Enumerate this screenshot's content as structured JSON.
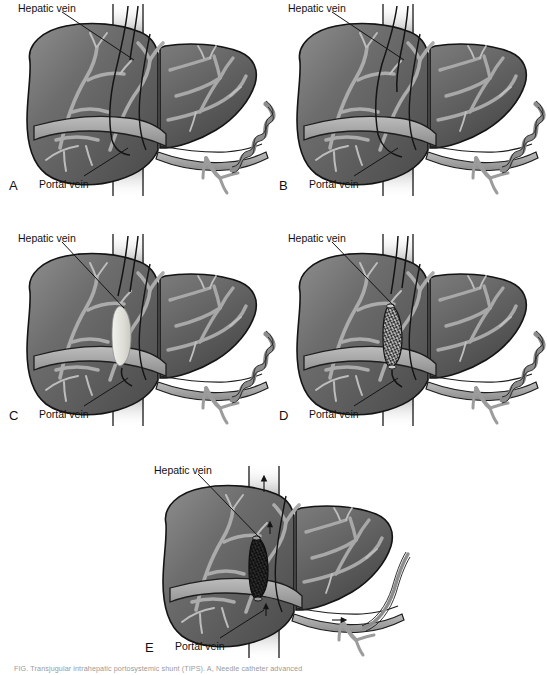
{
  "figure": {
    "type": "medical-illustration",
    "background_color": "#ffffff",
    "panel_count": 5,
    "caption": "FIG. Transjugular intrahepatic portosystemic shunt (TIPS). A, Needle catheter advanced"
  },
  "labels": {
    "hepatic_vein": "Hepatic vein",
    "portal_vein": "Portal vein"
  },
  "panels": [
    {
      "letter": "A",
      "label_hepatic": "Hepatic vein",
      "label_portal": "Portal vein",
      "stage": "catheter-in-hepatic-vein",
      "has_stent": false,
      "has_tract": false,
      "varices": "dilated"
    },
    {
      "letter": "B",
      "label_hepatic": "Hepatic vein",
      "label_portal": "Portal vein",
      "stage": "needle-puncture-to-portal-vein",
      "has_stent": false,
      "has_tract": false,
      "varices": "dilated"
    },
    {
      "letter": "C",
      "label_hepatic": "Hepatic vein",
      "label_portal": "Portal vein",
      "stage": "balloon-dilation-of-tract",
      "has_stent": false,
      "has_tract": true,
      "varices": "dilated"
    },
    {
      "letter": "D",
      "label_hepatic": "Hepatic vein",
      "label_portal": "Portal vein",
      "stage": "stent-deployed",
      "has_stent": true,
      "has_tract": false,
      "varices": "dilated"
    },
    {
      "letter": "E",
      "label_hepatic": "Hepatic vein",
      "label_portal": "Portal vein",
      "stage": "shunt-patent-varices-decompressed",
      "has_stent": true,
      "has_tract": false,
      "varices": "decompressed"
    }
  ],
  "colors": {
    "liver_dark": "#595959",
    "liver_mid": "#6f6f6f",
    "liver_light": "#8b8b8b",
    "vessel": "#a6a6a6",
    "vessel_light": "#b5b5b5",
    "ivc_band": "#bdbdbd",
    "outline": "#1a1a1a",
    "tract_white": "#e8e8e4",
    "stent_dark": "#2a2a2a",
    "label_text": "#111111",
    "caption_text": "#9a9a9a"
  }
}
